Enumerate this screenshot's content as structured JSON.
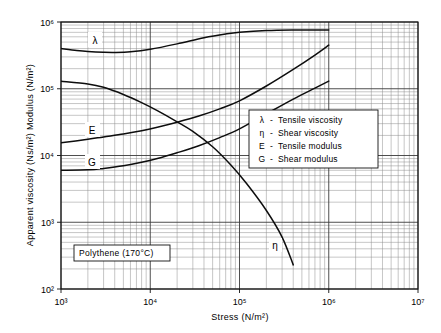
{
  "chart_data": {
    "type": "line",
    "title": "",
    "xlabel": "Stress (N/m²)",
    "ylabel": "Apparent viscosity (Ns/m²)  Modulus (N/m²)",
    "xscale": "log",
    "yscale": "log",
    "xlim": [
      1000,
      10000000
    ],
    "ylim": [
      100,
      1000000
    ],
    "grid": "log-minor-and-major",
    "legend_position": "center-right-inside",
    "xtick_labels": [
      "10³",
      "10⁴",
      "10⁵",
      "10⁶",
      "10⁷"
    ],
    "xtick_values": [
      1000,
      10000,
      100000,
      1000000,
      10000000
    ],
    "ytick_labels": [
      "10²",
      "10³",
      "10⁴",
      "10⁵",
      "10⁶"
    ],
    "ytick_values": [
      100,
      1000,
      10000,
      100000,
      1000000
    ],
    "annotation": "Polythene (170°C)",
    "series": [
      {
        "name": "λ",
        "legend_symbol": "λ",
        "legend_label": "Tensile viscosity",
        "curve_label": "λ",
        "x": [
          1000,
          1500,
          2000,
          3000,
          4000,
          6000,
          10000,
          20000,
          40000,
          70000,
          100000,
          200000,
          400000,
          700000,
          1000000
        ],
        "y": [
          400000,
          375000,
          362000,
          352000,
          350000,
          358000,
          390000,
          470000,
          580000,
          660000,
          700000,
          745000,
          760000,
          760000,
          758000
        ]
      },
      {
        "name": "η",
        "legend_symbol": "η",
        "legend_label": "Shear viscosity",
        "curve_label": "η",
        "x": [
          1000,
          2000,
          3000,
          5000,
          8000,
          12000,
          20000,
          30000,
          50000,
          80000,
          120000,
          200000,
          300000,
          400000
        ],
        "y": [
          130000,
          118000,
          105000,
          82000,
          62000,
          47000,
          32000,
          23000,
          13500,
          7200,
          3800,
          1500,
          600,
          230
        ]
      },
      {
        "name": "E",
        "legend_symbol": "E",
        "legend_label": "Tensile modulus",
        "curve_label": "E",
        "x": [
          1000,
          2000,
          3000,
          5000,
          8000,
          12000,
          20000,
          35000,
          60000,
          100000,
          200000,
          400000,
          700000,
          1000000
        ],
        "y": [
          15500,
          17500,
          19000,
          21000,
          23500,
          26500,
          31500,
          39000,
          50000,
          66000,
          110000,
          195000,
          320000,
          450000
        ]
      },
      {
        "name": "G",
        "legend_symbol": "G",
        "legend_label": "Shear modulus",
        "curve_label": "G",
        "x": [
          1000,
          2000,
          3000,
          5000,
          8000,
          12000,
          20000,
          35000,
          60000,
          100000,
          200000,
          400000,
          700000,
          1000000
        ],
        "y": [
          6000,
          6100,
          6400,
          7000,
          7900,
          9000,
          11000,
          14000,
          18500,
          25000,
          42000,
          70000,
          102000,
          130000
        ]
      }
    ],
    "legend_entries": [
      {
        "symbol": "λ",
        "dash": "-",
        "label": "Tensile viscosity"
      },
      {
        "symbol": "η",
        "dash": "-",
        "label": "Shear  viscosity"
      },
      {
        "symbol": "E",
        "dash": "-",
        "label": "Tensile modulus"
      },
      {
        "symbol": "G",
        "dash": "-",
        "label": "Shear  modulus"
      }
    ]
  }
}
